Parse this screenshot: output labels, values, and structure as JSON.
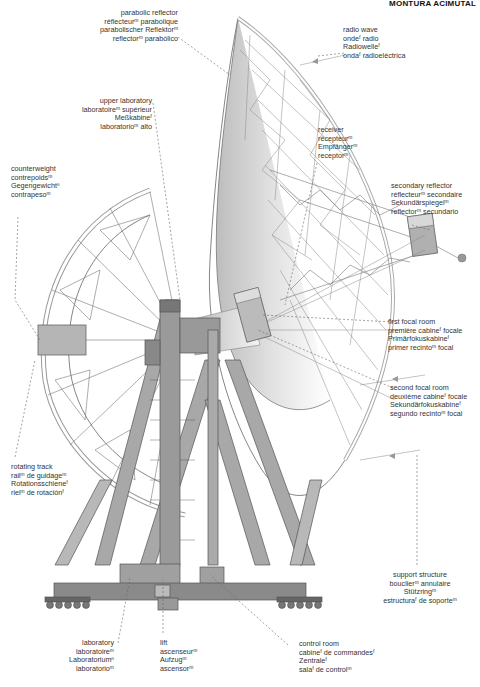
{
  "header": {
    "title": "MONTURA ACIMUTAL"
  },
  "labels": {
    "parabolic_reflector": [
      "parabolic reflector",
      "réflecteurᵐ parabolique",
      "parabolischer Reflektorᵐ",
      "reflectorᵐ parabólico"
    ],
    "radio_wave": [
      "radio wave",
      "ondeᶠ radio",
      "Radiowelleᶠ",
      "ondaᶠ radioeléctrica"
    ],
    "upper_laboratory": [
      "upper laboratory",
      "laboratoireᵐ supérieur",
      "Meßkabineᶠ",
      "laboratorioᵐ alto"
    ],
    "receiver": [
      "receiver",
      "récepteurᵐ",
      "Empfängerᵐ",
      "receptorᵐ"
    ],
    "counterweight": [
      "counterweight",
      "contrepoidsᵐ",
      "Gegengewichtⁿ",
      "contrapesoᵐ"
    ],
    "secondary_reflector": [
      "secondary reflector",
      "réflecteurᵐ secondaire",
      "Sekundärspiegelᵐ",
      "reflectorᵐ secundario"
    ],
    "first_focal_room": [
      "first focal room",
      "première cabineᶠ focale",
      "Primärfokuskabineᶠ",
      "primer recintoᵐ focal"
    ],
    "second_focal_room": [
      "second focal room",
      "deuxième cabineᶠ focale",
      "Sekundärfokuskabineᶠ",
      "segundo recintoᵐ focal"
    ],
    "rotating_track": [
      "rotating track",
      "railᵐ de guidageᵐ",
      "Rotationsschieneᶠ",
      "rielᵐ de rotaciónᶠ"
    ],
    "support_structure": [
      "support structure",
      "bouclierᵐ annulaire",
      "Stützringᵐ",
      "estructuraᶠ de soporteᵐ"
    ],
    "laboratory": [
      "laboratory",
      "laboratoireᵐ",
      "Laboratoriumⁿ",
      "laboratorioᵐ"
    ],
    "lift": [
      "lift",
      "ascenseurᵐ",
      "Aufzugᵐ",
      "ascensorᵐ"
    ],
    "control_room": [
      "control room",
      "cabineᶠ de commandesᶠ",
      "Zentraleᶠ",
      "salaᶠ de controlᵐ"
    ]
  },
  "colors": {
    "line": "#555555",
    "structure_fill": "#9a9a9a",
    "structure_dark": "#7a7a7a",
    "dish_shade": "#c8c8c8",
    "leader": "#666666"
  }
}
